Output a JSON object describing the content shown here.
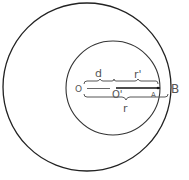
{
  "diagram": {
    "type": "concentric-offset-circles",
    "labels": {
      "center_outer": "O",
      "center_inner": "O'",
      "point_a": "A",
      "point_b": "B",
      "offset": "d",
      "inner_radius": "r'",
      "outer_radius": "r"
    },
    "colors": {
      "stroke": "#222222",
      "text": "#555555",
      "background": "#ffffff"
    }
  }
}
